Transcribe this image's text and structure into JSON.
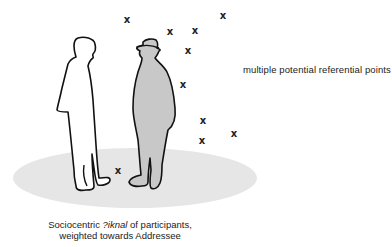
{
  "diagram": {
    "labels": {
      "referential_points": "multiple potential referential points",
      "caption_line1_prefix": "Sociocentric ",
      "caption_line1_italic": "?iknal",
      "caption_line1_suffix": " of participants,",
      "caption_line2": "weighted towards Addressee"
    },
    "figures": [
      {
        "name": "speaker",
        "fill": "#ffffff",
        "outline": "#111111"
      },
      {
        "name": "addressee",
        "fill": "#c8c8c8",
        "outline": "#111111",
        "wears_hat": true
      }
    ],
    "ground_ellipse": {
      "fill": "#e6e6e6",
      "cx": 135,
      "cy": 178,
      "rx": 122,
      "ry": 30
    },
    "x_marks": [
      {
        "x": 127,
        "y": 20,
        "glyph": "x"
      },
      {
        "x": 170,
        "y": 32,
        "glyph": "x"
      },
      {
        "x": 195,
        "y": 31,
        "glyph": "x"
      },
      {
        "x": 223,
        "y": 16,
        "glyph": "x"
      },
      {
        "x": 188,
        "y": 51,
        "glyph": "x"
      },
      {
        "x": 183,
        "y": 85,
        "glyph": "x"
      },
      {
        "x": 203,
        "y": 121,
        "glyph": "x"
      },
      {
        "x": 234,
        "y": 134,
        "glyph": "x"
      },
      {
        "x": 202,
        "y": 141,
        "glyph": "x"
      },
      {
        "x": 118,
        "y": 171,
        "glyph": "x"
      }
    ]
  }
}
